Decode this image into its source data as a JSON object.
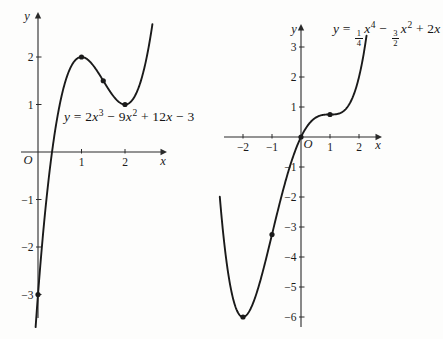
{
  "style": {
    "curve_color": "#1a1a1a",
    "axis_color": "#2a2a2a",
    "text_color": "#1a1a1a",
    "background": "#fdfdfc"
  },
  "chart_data": [
    {
      "type": "line",
      "title": "y = 2x^3 - 9x^2 + 12x - 3",
      "equation_label": {
        "plain": "y = 2x³ − 9x² + 12x − 3",
        "parts": [
          {
            "v": "y"
          },
          {
            "t": " = 2"
          },
          {
            "v": "x"
          },
          {
            "sup": "3"
          },
          {
            "t": " − 9"
          },
          {
            "v": "x"
          },
          {
            "sup": "2"
          },
          {
            "t": " + 12"
          },
          {
            "v": "x"
          },
          {
            "t": " − 3"
          }
        ]
      },
      "polynomial_coefficients": [
        2,
        -9,
        12,
        -3
      ],
      "x_domain": [
        -0.055,
        2.63
      ],
      "key_points": [
        [
          1,
          2
        ],
        [
          1.5,
          1.5
        ],
        [
          2,
          1
        ],
        [
          0,
          -3
        ]
      ],
      "x_ticks": [
        1,
        2
      ],
      "y_ticks": [
        2,
        1,
        -1,
        -2,
        -3
      ],
      "xlim": [
        -0.4,
        3.0
      ],
      "ylim": [
        -3.5,
        2.95
      ],
      "grid": false,
      "legend": false,
      "axis_labels": {
        "x": "x",
        "y": "y",
        "origin": "O"
      },
      "layout": {
        "origin_px": [
          38,
          152
        ],
        "x_unit_px": 43.5,
        "y_unit_px": 47.5,
        "x_axis_px": [
          21,
          167
        ],
        "y_axis_px": [
          12,
          318
        ],
        "x_label_px": [
          163,
          165
        ],
        "y_label_px": [
          27,
          20
        ],
        "origin_label_px": [
          28,
          164
        ],
        "equation_px": [
          64,
          108
        ]
      }
    },
    {
      "type": "line",
      "title": "y = 1/4 x^4 - 3/2 x^2 + 2x",
      "equation_label": {
        "plain": "y = 1/4 x⁴ − 3/2 x² + 2x",
        "parts": [
          {
            "v": "y"
          },
          {
            "t": " = "
          },
          {
            "frac": [
              "1",
              "4"
            ]
          },
          {
            "v": "x"
          },
          {
            "sup": "4"
          },
          {
            "t": " − "
          },
          {
            "frac": [
              "3",
              "2"
            ]
          },
          {
            "v": "x"
          },
          {
            "sup": "2"
          },
          {
            "t": " + 2"
          },
          {
            "v": "x"
          }
        ]
      },
      "polynomial_coefficients": [
        0.25,
        0,
        -1.5,
        2,
        0
      ],
      "x_domain": [
        -2.8,
        2.26
      ],
      "key_points": [
        [
          -2,
          -6
        ],
        [
          -1,
          -3.25
        ],
        [
          0,
          0
        ],
        [
          1,
          0.75
        ]
      ],
      "x_ticks": [
        -2,
        -1,
        1,
        2
      ],
      "y_ticks": [
        3,
        2,
        1,
        -1,
        -2,
        -3,
        -4,
        -5,
        -6
      ],
      "xlim": [
        -2.7,
        2.8
      ],
      "ylim": [
        -6.3,
        3.8
      ],
      "grid": false,
      "legend": false,
      "axis_labels": {
        "x": "x",
        "y": "y",
        "origin": "O"
      },
      "layout": {
        "origin_px": [
          301,
          137
        ],
        "x_unit_px": 29,
        "y_unit_px": 30,
        "x_axis_px": [
          224,
          382
        ],
        "y_axis_px": [
          24,
          327
        ],
        "x_label_px": [
          378,
          149
        ],
        "y_label_px": [
          294,
          33
        ],
        "origin_label_px": [
          308,
          148
        ],
        "equation_px": [
          333,
          20
        ]
      }
    }
  ]
}
